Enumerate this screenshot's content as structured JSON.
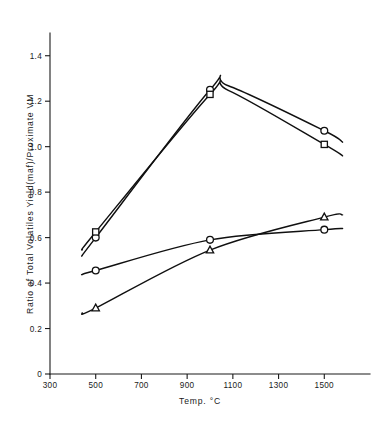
{
  "chart_data": {
    "type": "line",
    "title": "",
    "xlabel": "Temp. °C",
    "ylabel": "Ratio of Total Volatiles Yield(maf)/Proximate VM",
    "xlim": [
      300,
      1700
    ],
    "ylim": [
      0,
      1.5
    ],
    "xticks": [
      300,
      500,
      700,
      900,
      1100,
      1300,
      1500
    ],
    "xtick_labels": [
      "300",
      "500",
      "700",
      "900",
      "1100",
      "1300",
      "1500"
    ],
    "yticks": [
      0,
      0.2,
      0.4,
      0.6,
      0.8,
      1.0,
      1.2,
      1.4
    ],
    "ytick_labels": [
      "0",
      "0.2",
      "0.4",
      "0.6",
      "0.8",
      "1.0",
      "1.2",
      "1.4"
    ],
    "grid": false,
    "legend": "none",
    "series": [
      {
        "name": "upper-circle-series",
        "marker": "circle",
        "x": [
          500,
          1000,
          1500
        ],
        "y": [
          0.6,
          1.25,
          1.07
        ],
        "curve_start": [
          440,
          0.52
        ],
        "curve_end": [
          1580,
          1.02
        ]
      },
      {
        "name": "upper-square-series",
        "marker": "square",
        "x": [
          500,
          1000,
          1500
        ],
        "y": [
          0.625,
          1.23,
          1.01
        ],
        "curve_start": [
          440,
          0.545
        ],
        "curve_end": [
          1580,
          0.96
        ]
      },
      {
        "name": "lower-circle-series",
        "marker": "circle",
        "x": [
          500,
          1000,
          1500
        ],
        "y": [
          0.455,
          0.59,
          0.635
        ],
        "curve_start": [
          440,
          0.437
        ],
        "curve_end": [
          1580,
          0.64
        ]
      },
      {
        "name": "lower-triangle-series",
        "marker": "triangle",
        "x": [
          500,
          1000,
          1500
        ],
        "y": [
          0.29,
          0.545,
          0.69
        ],
        "curve_start": [
          440,
          0.268
        ],
        "curve_end": [
          1580,
          0.7
        ]
      }
    ],
    "colors": {
      "line": "#101010",
      "marker_fill": "#ffffff",
      "axis": "#1a1a1a",
      "background": "#ffffff"
    }
  }
}
